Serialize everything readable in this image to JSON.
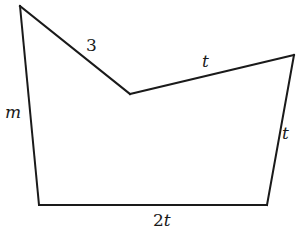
{
  "diagram": {
    "type": "pentagon",
    "vertices": [
      {
        "id": "A",
        "x": 20,
        "y": 6
      },
      {
        "id": "B",
        "x": 130,
        "y": 94
      },
      {
        "id": "C",
        "x": 294,
        "y": 55
      },
      {
        "id": "D",
        "x": 267,
        "y": 205
      },
      {
        "id": "E",
        "x": 39,
        "y": 205
      }
    ],
    "labels": {
      "side_top_left": "3",
      "side_top_right": "t",
      "side_left": "m",
      "side_right": "t",
      "side_bottom": "2t"
    },
    "stroke_color": "#1a1a1a",
    "background": "#ffffff"
  }
}
